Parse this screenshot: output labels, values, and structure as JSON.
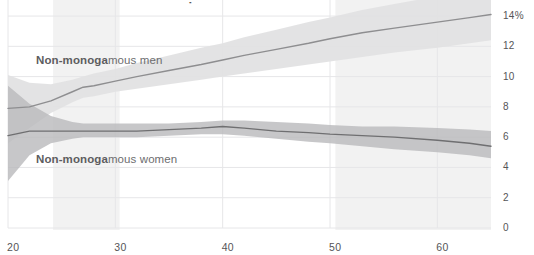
{
  "title_fragment": "Non-monogamy is more common among men as they age",
  "axes": {
    "y_tick_labels": [
      "14%",
      "12",
      "10",
      "8",
      "6",
      "4",
      "2",
      "0"
    ],
    "y_tick_values": [
      14,
      12,
      10,
      8,
      6,
      4,
      2,
      0
    ],
    "x_tick_labels": [
      "20",
      "30",
      "40",
      "50",
      "60"
    ],
    "x_tick_values": [
      20,
      30,
      40,
      50,
      60
    ]
  },
  "labels": {
    "men": "Non-monogamous men",
    "women": "Non-monogamous women"
  },
  "colors": {
    "men_line": "#8e8e90",
    "men_band": "#e2e2e3",
    "women_line": "#6f6f71",
    "women_band": "#b9b9bb",
    "gridline": "#e6e6e8",
    "axis_text": "#555557",
    "label_text": "#6d6d6f",
    "highlight_band": "#f2f2f2",
    "background": "#ffffff"
  },
  "chart_data": {
    "type": "line",
    "title": "Non-monogamy is more common among men as they age",
    "xlabel": "",
    "ylabel": "",
    "xlim": [
      20,
      65
    ],
    "ylim": [
      0,
      14.4
    ],
    "grid": true,
    "legend": "inline-labels",
    "x": [
      20,
      22,
      24,
      26,
      27,
      28,
      30,
      32,
      35,
      38,
      40,
      42,
      45,
      48,
      50,
      53,
      56,
      60,
      63,
      65
    ],
    "series": [
      {
        "name": "Non-monogamous men",
        "values": [
          7.9,
          8.0,
          8.4,
          9.0,
          9.3,
          9.4,
          9.7,
          10.0,
          10.4,
          10.8,
          11.1,
          11.4,
          11.8,
          12.2,
          12.5,
          12.9,
          13.2,
          13.6,
          13.9,
          14.1
        ],
        "band_low": [
          5.6,
          6.6,
          7.6,
          8.3,
          8.6,
          8.7,
          9.0,
          9.2,
          9.5,
          9.8,
          10.0,
          10.2,
          10.5,
          10.8,
          11.0,
          11.3,
          11.6,
          11.9,
          12.2,
          12.4
        ],
        "band_high": [
          10.1,
          9.6,
          9.5,
          9.8,
          10.0,
          10.2,
          10.5,
          10.9,
          11.4,
          11.9,
          12.2,
          12.6,
          13.1,
          13.6,
          13.9,
          14.4,
          14.8,
          15.3,
          15.7,
          15.9
        ]
      },
      {
        "name": "Non-monogamous women",
        "values": [
          6.1,
          6.4,
          6.4,
          6.4,
          6.4,
          6.4,
          6.4,
          6.4,
          6.5,
          6.6,
          6.7,
          6.6,
          6.4,
          6.3,
          6.2,
          6.1,
          6.0,
          5.8,
          5.6,
          5.4
        ],
        "band_low": [
          3.1,
          4.8,
          5.6,
          5.9,
          6.0,
          6.0,
          6.0,
          6.0,
          6.1,
          6.2,
          6.2,
          6.1,
          5.9,
          5.7,
          5.6,
          5.4,
          5.2,
          5.0,
          4.8,
          4.6
        ],
        "band_high": [
          9.4,
          8.2,
          7.4,
          7.0,
          6.9,
          6.9,
          6.9,
          6.9,
          6.9,
          7.0,
          7.1,
          7.1,
          7.0,
          6.9,
          6.8,
          6.7,
          6.7,
          6.6,
          6.5,
          6.4
        ]
      }
    ],
    "shaded_x_bands": [
      {
        "from": 24.2,
        "to": 30.4
      },
      {
        "from": 50.5,
        "to": 65.0
      }
    ]
  }
}
